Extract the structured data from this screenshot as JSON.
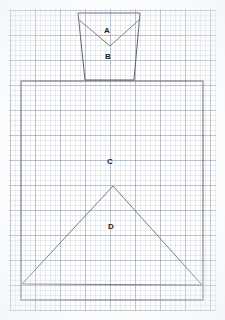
{
  "sheet": {
    "title": "Graph paper geometric sketch",
    "background_color": "#ffffff",
    "grid": {
      "minor_spacing_px": 5,
      "major_spacing_px": 25,
      "minor_color": "#96a3b6",
      "major_color": "#788496",
      "area": {
        "x": 9,
        "y": 9,
        "width": 207,
        "height": 302
      }
    }
  },
  "ink": {
    "stroke_color": "#5a5f6a",
    "stroke_width": 1
  },
  "labels": [
    {
      "id": "A",
      "text": "A",
      "x": 107,
      "y": 31
    },
    {
      "id": "B",
      "text": "B",
      "x": 108,
      "y": 57
    },
    {
      "id": "C",
      "text": "C",
      "x": 110,
      "y": 162
    },
    {
      "id": "D",
      "text": "D",
      "x": 111,
      "y": 227
    }
  ],
  "shapes": {
    "trapezoid": {
      "name": "upper-trapezoid",
      "points": "78,13 140,13 134,80 85,80",
      "description": "Inverted trapezoid at top of sheet"
    },
    "vee": {
      "name": "vee-fold",
      "points": "78,19 110,46 140,19",
      "description": "V shaped fold line inside trapezoid separating region A from region B"
    },
    "rectangle": {
      "name": "main-rectangle",
      "x": 21,
      "y": 81,
      "width": 182,
      "height": 219,
      "description": "Large rectangle forming region C"
    },
    "triangle": {
      "name": "gable-triangle",
      "points": "22,284 113,186 202,285",
      "description": "Large triangle inside rectangle forming region D"
    }
  },
  "regions": [
    {
      "label": "A",
      "name": "region-a",
      "shape": "triangle-top"
    },
    {
      "label": "B",
      "name": "region-b",
      "shape": "trapezoid-lower"
    },
    {
      "label": "C",
      "name": "region-c",
      "shape": "rectangle"
    },
    {
      "label": "D",
      "name": "region-d",
      "shape": "triangle"
    }
  ]
}
